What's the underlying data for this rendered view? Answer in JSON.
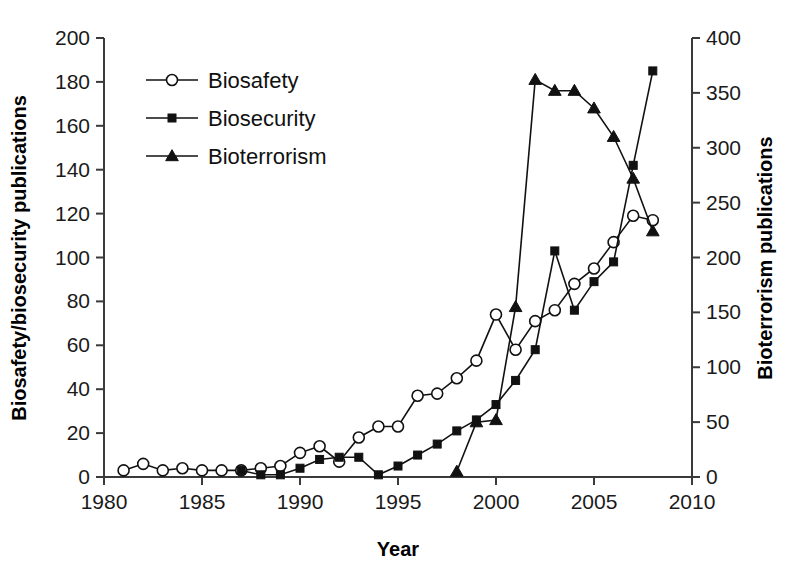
{
  "chart_data": {
    "type": "line",
    "title": "",
    "xlabel": "Year",
    "ylabel": "Biosafety/biosecurity publications",
    "y2label": "Bioterrorism publications",
    "xlim": [
      1980,
      2010
    ],
    "ylim": [
      0,
      200
    ],
    "y2lim": [
      0,
      400
    ],
    "xticks": [
      1980,
      1985,
      1990,
      1995,
      2000,
      2005,
      2010
    ],
    "yticks": [
      0,
      20,
      40,
      60,
      80,
      100,
      120,
      140,
      160,
      180,
      200
    ],
    "y2ticks": [
      0,
      50,
      100,
      150,
      200,
      250,
      300,
      350,
      400
    ],
    "grid": false,
    "legend_position": "upper-left",
    "series": [
      {
        "name": "Biosafety",
        "axis": "left",
        "marker": "open-circle",
        "x": [
          1981,
          1982,
          1983,
          1984,
          1985,
          1986,
          1987,
          1988,
          1989,
          1990,
          1991,
          1992,
          1993,
          1994,
          1995,
          1996,
          1997,
          1998,
          1999,
          2000,
          2001,
          2002,
          2003,
          2004,
          2005,
          2006,
          2007,
          2008
        ],
        "values": [
          3,
          6,
          3,
          4,
          3,
          3,
          3,
          4,
          5,
          11,
          14,
          7,
          18,
          23,
          23,
          37,
          38,
          45,
          53,
          74,
          58,
          71,
          76,
          88,
          95,
          107,
          119,
          117
        ]
      },
      {
        "name": "Biosecurity",
        "axis": "left",
        "marker": "filled-square",
        "x": [
          1987,
          1988,
          1989,
          1990,
          1991,
          1992,
          1993,
          1994,
          1995,
          1996,
          1997,
          1998,
          1999,
          2000,
          2001,
          2002,
          2003,
          2004,
          2005,
          2006,
          2007,
          2008
        ],
        "values": [
          3,
          1,
          1,
          4,
          8,
          9,
          9,
          1,
          5,
          10,
          15,
          21,
          26,
          33,
          44,
          58,
          103,
          76,
          89,
          98,
          142,
          185
        ]
      },
      {
        "name": "Bioterrorism",
        "axis": "right",
        "marker": "filled-triangle",
        "x": [
          1998,
          1999,
          2000,
          2001,
          2002,
          2003,
          2004,
          2005,
          2006,
          2007,
          2008
        ],
        "values": [
          5,
          50,
          52,
          155,
          362,
          352,
          352,
          336,
          310,
          272,
          224
        ]
      }
    ]
  },
  "legend": {
    "items": [
      {
        "label": "Biosafety"
      },
      {
        "label": "Biosecurity"
      },
      {
        "label": "Bioterrorism"
      }
    ]
  },
  "axes": {
    "x_title": "Year",
    "y_left_title": "Biosafety/biosecurity publications",
    "y_right_title": "Bioterrorism publications"
  }
}
